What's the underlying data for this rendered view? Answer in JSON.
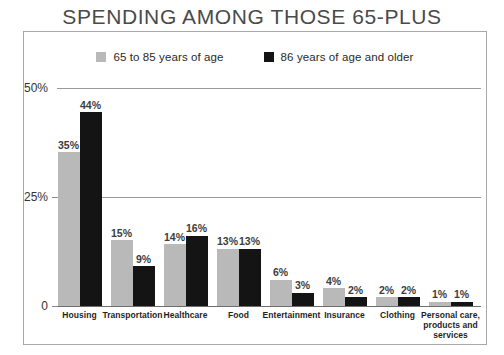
{
  "chart_data": {
    "type": "bar",
    "title": "SPENDING AMONG THOSE 65-PLUS",
    "xlabel": "",
    "ylabel": "",
    "ylim": [
      0,
      50
    ],
    "grid": true,
    "legend_position": "top-center",
    "ytick_labels": [
      "50%",
      "25%",
      "0"
    ],
    "ytick_values": [
      50,
      25,
      0
    ],
    "categories": [
      "Housing",
      "Transportation",
      "Healthcare",
      "Food",
      "Entertainment",
      "Insurance",
      "Clothing",
      "Personal care, products and services"
    ],
    "category_label_lines": [
      [
        "Housing"
      ],
      [
        "Transportation"
      ],
      [
        "Healthcare"
      ],
      [
        "Food"
      ],
      [
        "Entertainment"
      ],
      [
        "Insurance"
      ],
      [
        "Clothing"
      ],
      [
        "Personal care,",
        "products and",
        "services"
      ]
    ],
    "series": [
      {
        "name": "65 to 85 years of age",
        "color": "#b9b9b9",
        "values": [
          35,
          15,
          14,
          13,
          6,
          4,
          2,
          1
        ],
        "value_labels": [
          "35%",
          "15%",
          "14%",
          "13%",
          "6%",
          "4%",
          "2%",
          "1%"
        ]
      },
      {
        "name": "86 years of age and older",
        "color": "#141414",
        "values": [
          44,
          9,
          16,
          13,
          3,
          2,
          2,
          1
        ],
        "value_labels": [
          "44%",
          "9%",
          "16%",
          "13%",
          "3%",
          "2%",
          "2%",
          "1%"
        ]
      }
    ]
  },
  "legend": {
    "entries": [
      {
        "label": "65 to 85 years of age",
        "color": "#b9b9b9"
      },
      {
        "label": "86 years of age and older",
        "color": "#141414"
      }
    ]
  },
  "colors": {
    "series_a": "#b9b9b9",
    "series_b": "#141414",
    "frame": "#a9a9a9",
    "gridline": "#9a9a9a",
    "title_text": "#4a4a4a",
    "label_text": "#1f1f1f"
  }
}
